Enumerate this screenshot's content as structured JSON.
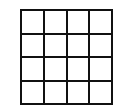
{
  "diagram": {
    "type": "grid",
    "rows": 4,
    "columns": 4,
    "line_color": "#111111",
    "fill_color": "#ffffff",
    "cells": [
      [
        "",
        "",
        "",
        ""
      ],
      [
        "",
        "",
        "",
        ""
      ],
      [
        "",
        "",
        "",
        ""
      ],
      [
        "",
        "",
        "",
        ""
      ]
    ]
  }
}
